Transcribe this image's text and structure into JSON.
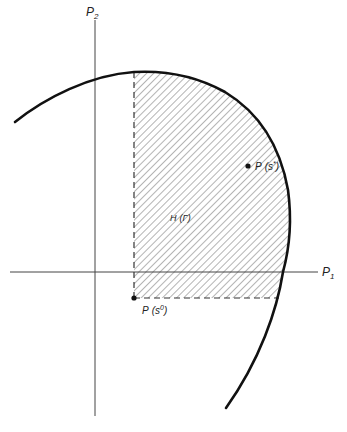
{
  "diagram": {
    "type": "payoff-set",
    "axes": {
      "x_label": "P",
      "x_sub": "1",
      "y_label": "P",
      "y_sub": "2"
    },
    "region_label": {
      "main": "H",
      "arg": "(Γ)"
    },
    "points": [
      {
        "id": "s0",
        "label": "P",
        "arg": "(s",
        "sup": "0",
        "close": ")"
      },
      {
        "id": "sstar",
        "label": "P",
        "arg": "(s",
        "sup": "*",
        "close": ")"
      }
    ],
    "colors": {
      "curve": "#111111",
      "axes": "#444444",
      "hatch": "#6a6a6a",
      "dashed": "#333333",
      "background": "#ffffff"
    }
  }
}
